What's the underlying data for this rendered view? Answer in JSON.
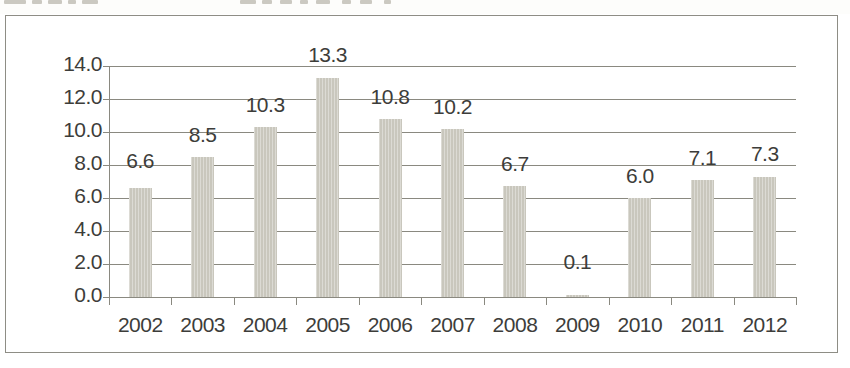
{
  "chart_data": {
    "type": "bar",
    "title": "",
    "xlabel": "",
    "ylabel": "",
    "categories": [
      "2002",
      "2003",
      "2004",
      "2005",
      "2006",
      "2007",
      "2008",
      "2009",
      "2010",
      "2011",
      "2012"
    ],
    "values": [
      6.6,
      8.5,
      10.3,
      13.3,
      10.8,
      10.2,
      6.7,
      0.1,
      6.0,
      7.1,
      7.3
    ],
    "data_labels": [
      "6.6",
      "8.5",
      "10.3",
      "13.3",
      "10.8",
      "10.2",
      "6.7",
      "0.1",
      "6.0",
      "7.1",
      "7.3"
    ],
    "ylim": [
      0.0,
      14.0
    ],
    "ytick_step": 2.0,
    "ytick_labels": [
      "14.0",
      "12.0",
      "10.0",
      "8.0",
      "6.0",
      "4.0",
      "2.0",
      "0.0"
    ],
    "ytick_values": [
      14.0,
      12.0,
      10.0,
      8.0,
      6.0,
      4.0,
      2.0,
      0.0
    ],
    "grid": true,
    "grid_axis": "y",
    "legend": false,
    "legend_position": "none",
    "series": [
      {
        "name": "",
        "values": [
          6.6,
          8.5,
          10.3,
          13.3,
          10.8,
          10.2,
          6.7,
          0.1,
          6.0,
          7.1,
          7.3
        ]
      }
    ]
  },
  "colors": {
    "bar_fill": "#c9c7bd",
    "axis_line": "#8a8980",
    "grid_line": "#8a8980",
    "text": "#3d3d3a",
    "frame_border": "#8e8d85",
    "background": "#ffffff"
  },
  "label_levels": {
    "comment": "vertical level, in data units, at which each bar's value label is drawn",
    "values": [
      8.0,
      9.6,
      11.4,
      14.4,
      11.9,
      11.3,
      7.8,
      1.9,
      7.1,
      8.2,
      8.4
    ]
  }
}
